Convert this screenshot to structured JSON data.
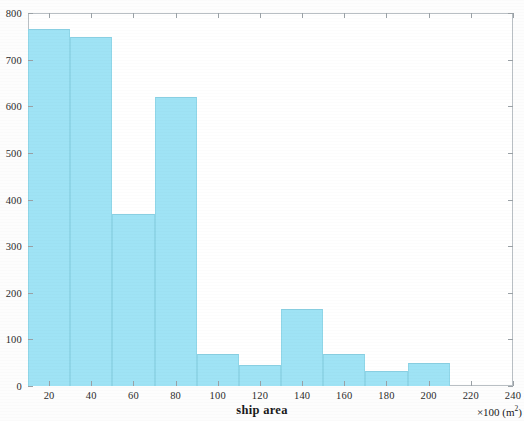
{
  "chart_data": {
    "type": "bar",
    "title": "",
    "subtitle": "",
    "xlabel": "ship area",
    "ylabel": "",
    "x_unit_note": "×100 (m",
    "x_unit_exponent": "2",
    "x_unit_close": ")",
    "xlim": [
      10,
      240
    ],
    "ylim": [
      0,
      800
    ],
    "bin_width": 20,
    "grid": false,
    "legend": null,
    "bar_color": "#9FE3F5",
    "bar_edge_color": "#89CFE2",
    "axis_color": "#B9BFC4",
    "categories": [
      "10-30",
      "30-50",
      "50-70",
      "70-90",
      "90-110",
      "110-130",
      "130-150",
      "150-170",
      "170-190",
      "190-210"
    ],
    "bin_edges": [
      10,
      30,
      50,
      70,
      90,
      110,
      130,
      150,
      170,
      190,
      210
    ],
    "values": [
      765,
      748,
      370,
      620,
      68,
      45,
      165,
      68,
      33,
      50
    ],
    "xticks": [
      20,
      40,
      60,
      80,
      100,
      120,
      140,
      160,
      180,
      200,
      220,
      240
    ],
    "xtick_labels": [
      "20",
      "40",
      "60",
      "80",
      "100",
      "120",
      "140",
      "160",
      "180",
      "200",
      "220",
      "240"
    ],
    "yticks": [
      0,
      100,
      200,
      300,
      400,
      500,
      600,
      700,
      800
    ],
    "ytick_labels": [
      "0",
      "100",
      "200",
      "300",
      "400",
      "500",
      "600",
      "700",
      "800"
    ]
  }
}
